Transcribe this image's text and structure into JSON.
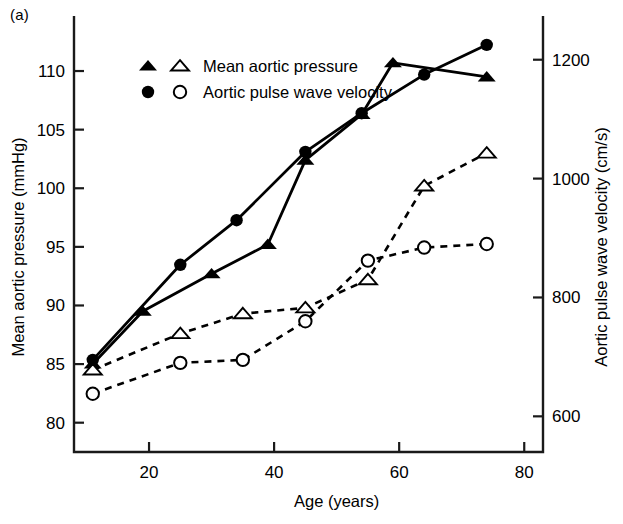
{
  "panel": {
    "label": "(a)"
  },
  "legend": {
    "entries": [
      {
        "label": "Mean aortic pressure",
        "markers": [
          "filled-triangle",
          "open-triangle"
        ]
      },
      {
        "label": "Aortic pulse wave velocity",
        "markers": [
          "filled-circle",
          "open-circle"
        ]
      }
    ]
  },
  "chart_data": {
    "type": "line",
    "title": "",
    "xlabel": "Age (years)",
    "ylabel": "Mean aortic pressure (mmHg)",
    "y2label": "Aortic pulse wave velocity (cm/s)",
    "xlim": [
      8,
      83
    ],
    "xticks": [
      20,
      40,
      60,
      80
    ],
    "ylim": [
      77.5,
      113.5
    ],
    "yticks": [
      80,
      85,
      90,
      95,
      100,
      105,
      110
    ],
    "y2lim": [
      540,
      1250
    ],
    "y2ticks": [
      600,
      800,
      1000,
      1200
    ],
    "grid": false,
    "legend_position": "top-left-inside",
    "series": [
      {
        "name": "Mean aortic pressure",
        "marker": "filled-triangle",
        "linestyle": "solid",
        "axis": "left",
        "units": "mmHg",
        "points": [
          {
            "x": 11,
            "y": 85.0
          },
          {
            "x": 19,
            "y": 89.5
          },
          {
            "x": 30,
            "y": 92.7
          },
          {
            "x": 39,
            "y": 95.2
          },
          {
            "x": 45,
            "y": 102.4
          },
          {
            "x": 54,
            "y": 106.3
          },
          {
            "x": 59,
            "y": 110.7
          },
          {
            "x": 74,
            "y": 109.5
          }
        ]
      },
      {
        "name": "Mean aortic pressure",
        "marker": "open-triangle",
        "linestyle": "dashed",
        "axis": "left",
        "units": "mmHg",
        "points": [
          {
            "x": 11,
            "y": 84.5
          },
          {
            "x": 25,
            "y": 87.6
          },
          {
            "x": 35,
            "y": 89.3
          },
          {
            "x": 45,
            "y": 89.8
          },
          {
            "x": 55,
            "y": 92.2
          },
          {
            "x": 64,
            "y": 100.2
          },
          {
            "x": 74,
            "y": 103.0
          }
        ]
      },
      {
        "name": "Aortic pulse wave velocity",
        "marker": "filled-circle",
        "linestyle": "solid",
        "axis": "right",
        "units": "cm/s",
        "points": [
          {
            "x": 11,
            "y": 695
          },
          {
            "x": 25,
            "y": 855
          },
          {
            "x": 34,
            "y": 930
          },
          {
            "x": 45,
            "y": 1045
          },
          {
            "x": 54,
            "y": 1110
          },
          {
            "x": 64,
            "y": 1175
          },
          {
            "x": 74,
            "y": 1225
          }
        ]
      },
      {
        "name": "Aortic pulse wave velocity",
        "marker": "open-circle",
        "linestyle": "dashed",
        "axis": "right",
        "units": "cm/s",
        "points": [
          {
            "x": 11,
            "y": 638
          },
          {
            "x": 25,
            "y": 690
          },
          {
            "x": 35,
            "y": 695
          },
          {
            "x": 45,
            "y": 760
          },
          {
            "x": 55,
            "y": 862
          },
          {
            "x": 64,
            "y": 884
          },
          {
            "x": 74,
            "y": 890
          }
        ]
      }
    ]
  }
}
